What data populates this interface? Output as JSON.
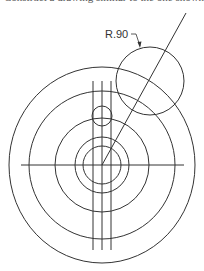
{
  "caption": "Construct a drawing similar to the one shown.",
  "diagram": {
    "dimension_label": "R.90",
    "stroke_color": "#333333",
    "center": {
      "x": 102,
      "y": 165
    },
    "concentric_circles": [
      {
        "name": "outer",
        "rx": 93,
        "ry": 98
      },
      {
        "name": "second",
        "rx": 73,
        "ry": 74
      },
      {
        "name": "third",
        "rx": 47,
        "ry": 47
      },
      {
        "name": "fourth",
        "rx": 27,
        "ry": 28
      },
      {
        "name": "inner",
        "rx": 19,
        "ry": 19
      }
    ],
    "small_circle": {
      "cx": 102,
      "cy": 116,
      "r": 10
    },
    "radius_circle": {
      "cx": 150,
      "cy": 81,
      "r": 34
    },
    "diagonal_line": {
      "x1": 102,
      "y1": 165,
      "x2": 186,
      "y2": 13
    },
    "horizontal_line": {
      "x1": 21,
      "y1": 165,
      "x2": 184,
      "y2": 165
    },
    "vertical_lines": [
      {
        "x": 93,
        "y1": 81,
        "y2": 250
      },
      {
        "x": 102,
        "y1": 81,
        "y2": 250
      },
      {
        "x": 111,
        "y1": 81,
        "y2": 250
      }
    ]
  }
}
